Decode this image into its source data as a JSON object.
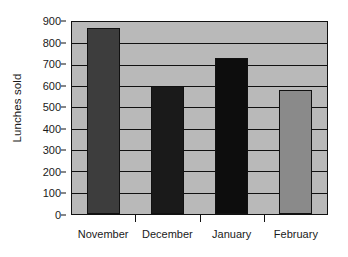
{
  "chart_data": {
    "type": "bar",
    "title": "",
    "xlabel": "",
    "ylabel": "Lunches sold",
    "categories": [
      "November",
      "December",
      "January",
      "February"
    ],
    "values": [
      870,
      600,
      730,
      580
    ],
    "bar_colors": [
      "#3d3d3d",
      "#1a1a1a",
      "#0d0d0d",
      "#8a8a8a"
    ],
    "ylim": [
      0,
      900
    ],
    "ytick_step": 100,
    "yticks": [
      0,
      100,
      200,
      300,
      400,
      500,
      600,
      700,
      800,
      900
    ],
    "ytick_labels": [
      "0",
      "100",
      "200",
      "300",
      "400",
      "500",
      "600",
      "700",
      "800",
      "900"
    ],
    "grid": true,
    "grid_orientation": "horizontal",
    "legend": false,
    "legend_position": "none",
    "plot_background": "#b9b9b9",
    "figure_background": "#ffffff",
    "axis_color": "#111111",
    "series": [
      {
        "name": "Lunches sold",
        "points": [
          {
            "category": "November",
            "value": 870,
            "color": "#3d3d3d"
          },
          {
            "category": "December",
            "value": 600,
            "color": "#1a1a1a"
          },
          {
            "category": "January",
            "value": 730,
            "color": "#0d0d0d"
          },
          {
            "category": "February",
            "value": 580,
            "color": "#8a8a8a"
          }
        ]
      }
    ]
  }
}
